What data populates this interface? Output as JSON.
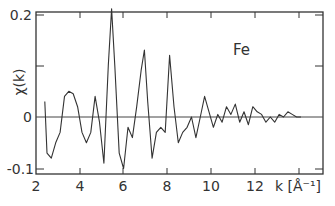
{
  "chart_data": {
    "type": "line",
    "title": "",
    "annotation": "Fe",
    "xlabel": "k [Å⁻¹]",
    "ylabel": "χ(k)",
    "xlim": [
      2,
      15
    ],
    "ylim": [
      -0.1,
      0.2
    ],
    "x_ticks": [
      "2",
      "4",
      "6",
      "8",
      "10",
      "12"
    ],
    "y_ticks": [
      "0.2",
      "0",
      "-0.1"
    ],
    "grid": false,
    "legend": null,
    "zero_line": true,
    "series": [
      {
        "name": "Fe EXAFS χ(k)",
        "x": [
          2.4,
          2.5,
          2.7,
          2.9,
          3.1,
          3.3,
          3.5,
          3.7,
          3.9,
          4.1,
          4.3,
          4.5,
          4.7,
          4.9,
          5.1,
          5.3,
          5.45,
          5.6,
          5.8,
          6.0,
          6.2,
          6.4,
          6.6,
          6.8,
          6.95,
          7.1,
          7.3,
          7.5,
          7.7,
          7.9,
          8.1,
          8.3,
          8.5,
          8.7,
          8.9,
          9.1,
          9.3,
          9.5,
          9.7,
          9.9,
          10.1,
          10.3,
          10.5,
          10.7,
          10.9,
          11.1,
          11.3,
          11.5,
          11.7,
          11.9,
          12.1,
          12.3,
          12.5,
          12.7,
          12.9,
          13.1,
          13.3,
          13.5,
          13.7,
          13.9,
          14.1
        ],
        "y": [
          0.03,
          -0.07,
          -0.08,
          -0.05,
          -0.03,
          0.04,
          0.05,
          0.045,
          0.02,
          -0.03,
          -0.05,
          -0.03,
          0.04,
          -0.01,
          -0.09,
          0.1,
          0.21,
          0.1,
          -0.07,
          -0.1,
          -0.02,
          -0.04,
          0.02,
          0.09,
          0.13,
          0.03,
          -0.08,
          -0.03,
          -0.02,
          -0.03,
          0.12,
          0.02,
          -0.05,
          -0.03,
          -0.02,
          0.0,
          -0.04,
          0.0,
          0.04,
          0.01,
          -0.02,
          0.005,
          -0.01,
          0.02,
          0.005,
          0.025,
          -0.01,
          0.01,
          -0.015,
          0.02,
          0.01,
          0.005,
          -0.01,
          0.0,
          -0.01,
          0.005,
          0.0,
          0.01,
          0.005,
          0.0,
          0.0
        ]
      }
    ]
  }
}
